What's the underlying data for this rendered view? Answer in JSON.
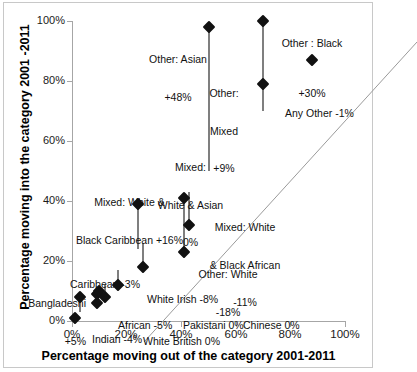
{
  "chart_data": {
    "type": "scatter",
    "title": "",
    "xlabel": "Percentage moving out of the category 2001-2011",
    "ylabel": "Percentage moving into the category 2001 -2011",
    "xlim": [
      0,
      100
    ],
    "ylim": [
      0,
      100
    ],
    "xticks": [
      "0%",
      "20%",
      "40%",
      "60%",
      "80%",
      "100%"
    ],
    "yticks": [
      "0%",
      "20%",
      "40%",
      "60%",
      "80%",
      "100%"
    ],
    "xtick_values": [
      0,
      20,
      40,
      60,
      80,
      100
    ],
    "ytick_values": [
      0,
      20,
      40,
      60,
      80,
      100
    ],
    "grid": false,
    "legend": "none",
    "reference_line": {
      "type": "identity",
      "description": "y = x diagonal"
    },
    "marker_style": "black diamond",
    "connector_style": "gray vertical segment",
    "points": [
      {
        "name": "White British",
        "x": 1,
        "y": 1,
        "change": "0%",
        "label": "White British 0%"
      },
      {
        "name": "Bangladeshi",
        "x": 3,
        "y": 8,
        "change": "+5%",
        "label": "Bangladeshi\n+5%"
      },
      {
        "name": "Caribbean",
        "x": 9,
        "y": 6,
        "change": "-3%",
        "label": "Caribbean -3%"
      },
      {
        "name": "Pakistani",
        "x": 9,
        "y": 9,
        "change": "0%",
        "label": "Pakistani 0%"
      },
      {
        "name": "Chinese",
        "x": 10,
        "y": 10,
        "change": "0%",
        "label": "Chinese 0%"
      },
      {
        "name": "Indian",
        "x": 12,
        "y": 8,
        "change": "-4%",
        "label": "Indian -4%"
      },
      {
        "name": "African",
        "x": 17,
        "y": 12,
        "change": "-5%",
        "label": "African -5%"
      },
      {
        "name": "Mixed: White & Black Caribbean",
        "x": 24,
        "y": 39,
        "change": "+16%",
        "label": "Mixed: White &\nBlack Caribbean +16%"
      },
      {
        "name": "White Irish",
        "x": 26,
        "y": 18,
        "change": "-8%",
        "label": "White Irish -8%"
      },
      {
        "name": "Mixed: White & Asian",
        "x": 41,
        "y": 41,
        "change": "0%",
        "label": "Mixed:\nWhite & Asian\n0%"
      },
      {
        "name": "Other: White",
        "x": 41,
        "y": 23,
        "change": "-18%",
        "label": "Other: White\n-18%"
      },
      {
        "name": "Mixed: White & Black African",
        "x": 43,
        "y": 32,
        "change": "-11%",
        "label": "Mixed: White\n& Black African\n-11%"
      },
      {
        "name": "Other: Asian",
        "x": 50,
        "y": 98,
        "change": "+48%",
        "label": "Other: Asian\n+48%"
      },
      {
        "name": "Other: Mixed",
        "x": 70,
        "y": 79,
        "change": "+9%",
        "label": "Other:\nMixed\n+9%"
      },
      {
        "name": "Other : Black",
        "x": 70,
        "y": 100,
        "change": "+30%",
        "label": "Other : Black\n+30%"
      },
      {
        "name": "Any Other",
        "x": 88,
        "y": 87,
        "change": "-1%",
        "label": "Any Other -1%"
      }
    ],
    "connectors": [
      {
        "name": "Bangladeshi",
        "x": 3,
        "y0": 3,
        "y1": 8
      },
      {
        "name": "Caribbean",
        "x": 9,
        "y0": 9,
        "y1": 6
      },
      {
        "name": "Indian",
        "x": 12,
        "y0": 12,
        "y1": 8
      },
      {
        "name": "African",
        "x": 17,
        "y0": 17,
        "y1": 12
      },
      {
        "name": "Mixed: White & Black Caribbean",
        "x": 24,
        "y0": 24,
        "y1": 39
      },
      {
        "name": "White Irish",
        "x": 26,
        "y0": 26,
        "y1": 18
      },
      {
        "name": "Other: White",
        "x": 41,
        "y0": 41,
        "y1": 23
      },
      {
        "name": "Mixed: White & Black African",
        "x": 43,
        "y0": 43,
        "y1": 32
      },
      {
        "name": "Other: Asian",
        "x": 50,
        "y0": 50,
        "y1": 98
      },
      {
        "name": "Other: Mixed",
        "x": 70,
        "y0": 70,
        "y1": 79
      },
      {
        "name": "Other : Black",
        "x": 70,
        "y0": 70,
        "y1": 100
      }
    ]
  },
  "axes": {
    "y_title": "Percentage moving into the category 2001 -2011",
    "x_title": "Percentage moving out of the category 2001-2011",
    "y_tick_labels": [
      "100%",
      "80%",
      "60%",
      "40%",
      "20%",
      "0%"
    ],
    "x_tick_labels": [
      "0%",
      "20%",
      "40%",
      "60%",
      "80%",
      "100%"
    ]
  },
  "annotations": [
    {
      "id": "other-asian",
      "line1": "Other: Asian",
      "line2": "+48%",
      "line3": ""
    },
    {
      "id": "other-black",
      "line1": "Other : Black",
      "line2": "+30%",
      "line3": ""
    },
    {
      "id": "other-mixed",
      "line1": "Other:",
      "line2": "Mixed",
      "line3": "+9%"
    },
    {
      "id": "any-other",
      "line1": "Any Other -1%",
      "line2": "",
      "line3": ""
    },
    {
      "id": "mixed-white-asian",
      "line1": "Mixed:",
      "line2": "White & Asian",
      "line3": "0%"
    },
    {
      "id": "mixed-wb-caribbean",
      "line1": "Mixed: White &",
      "line2": "Black Caribbean +16%",
      "line3": ""
    },
    {
      "id": "mixed-wb-african",
      "line1": "Mixed: White",
      "line2": "& Black African",
      "line3": "-11%"
    },
    {
      "id": "other-white",
      "line1": "Other: White",
      "line2": "-18%",
      "line3": ""
    },
    {
      "id": "caribbean",
      "line1": "Caribbean -3%",
      "line2": "",
      "line3": ""
    },
    {
      "id": "white-irish",
      "line1": "White Irish -8%",
      "line2": "",
      "line3": ""
    },
    {
      "id": "bangladeshi",
      "line1": "Bangladeshi",
      "line2": "+5%",
      "line3": ""
    },
    {
      "id": "african",
      "line1": "African -5%",
      "line2": "",
      "line3": ""
    },
    {
      "id": "indian",
      "line1": "Indian -4%",
      "line2": "",
      "line3": ""
    },
    {
      "id": "pakistani",
      "line1": "Pakistani 0%",
      "line2": "",
      "line3": ""
    },
    {
      "id": "chinese",
      "line1": "Chinese 0%",
      "line2": "",
      "line3": ""
    },
    {
      "id": "white-british",
      "line1": "White British 0%",
      "line2": "",
      "line3": ""
    }
  ],
  "colors": {
    "marker": "#111111",
    "connector": "#7f7f7f",
    "axis": "#a6a6a6",
    "diagonal": "#9a9a9a",
    "text": "#111111",
    "background": "#ffffff",
    "frame": "#c8c8c8"
  }
}
